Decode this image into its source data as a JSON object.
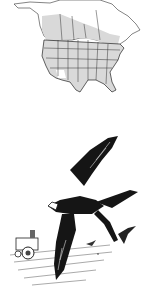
{
  "figure": {
    "map": {
      "subject": "north-america-range-map",
      "range_fill": "#d9d9d9",
      "land_fill": "#ffffff",
      "border_color": "#222222"
    },
    "illustration": {
      "subject": "swallow-in-flight-over-farm",
      "ink_color": "#151515",
      "background": "#ffffff"
    }
  }
}
